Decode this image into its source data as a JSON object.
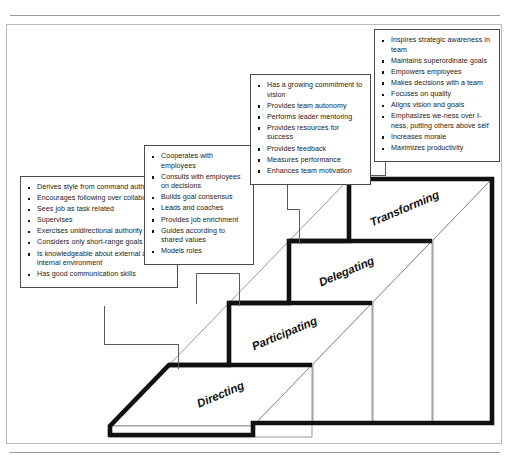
{
  "figure": {
    "colors": {
      "outline": "#111111",
      "face_stroke": "#6b6b6b",
      "box_border": "#4a4a4a",
      "connector": "#5a5a5a",
      "rule": "#9a9a9a",
      "text": "#1a1a1a",
      "background": "#ffffff"
    }
  },
  "steps": [
    {
      "id": "directing",
      "label": "Directing"
    },
    {
      "id": "participating",
      "label": "Participating"
    },
    {
      "id": "delegating",
      "label": "Delegating"
    },
    {
      "id": "transforming",
      "label": "Transforming"
    }
  ],
  "callouts": {
    "directing": {
      "step": "Directing",
      "items": [
        "Derives style from command authority",
        "Encourages following over collaboration",
        "Sees job as task related",
        "Supervises",
        "Exercises unidirectional authority",
        "Considers only short-range goals",
        "Is knowledgeable about external and internal environment",
        "Has good communication skills"
      ]
    },
    "participating": {
      "step": "Participating",
      "items": [
        "Cooperates with employees",
        "Consults with employees on decisions",
        "Builds goal consensus",
        "Leads and coaches",
        "Provides job enrichment",
        "Guides according to shared values",
        "Models roles"
      ]
    },
    "delegating": {
      "step": "Delegating",
      "items": [
        "Has a growing commitment to vision",
        "Provides team autonomy",
        "Performs leader mentoring",
        "Provides resources for success",
        "Provides feedback",
        "Measures performance",
        "Enhances team motivation"
      ]
    },
    "transforming": {
      "step": "Transforming",
      "items": [
        "Inspires strategic awareness in team",
        "Maintains superordinate goals",
        "Empowers employees",
        "Makes decisions with a team",
        "Focuses on quality",
        "Aligns vision and goals",
        "Emphasizes we-ness over I-ness, putting others above self",
        "Increases morale",
        "Maximizes productivity"
      ]
    }
  }
}
